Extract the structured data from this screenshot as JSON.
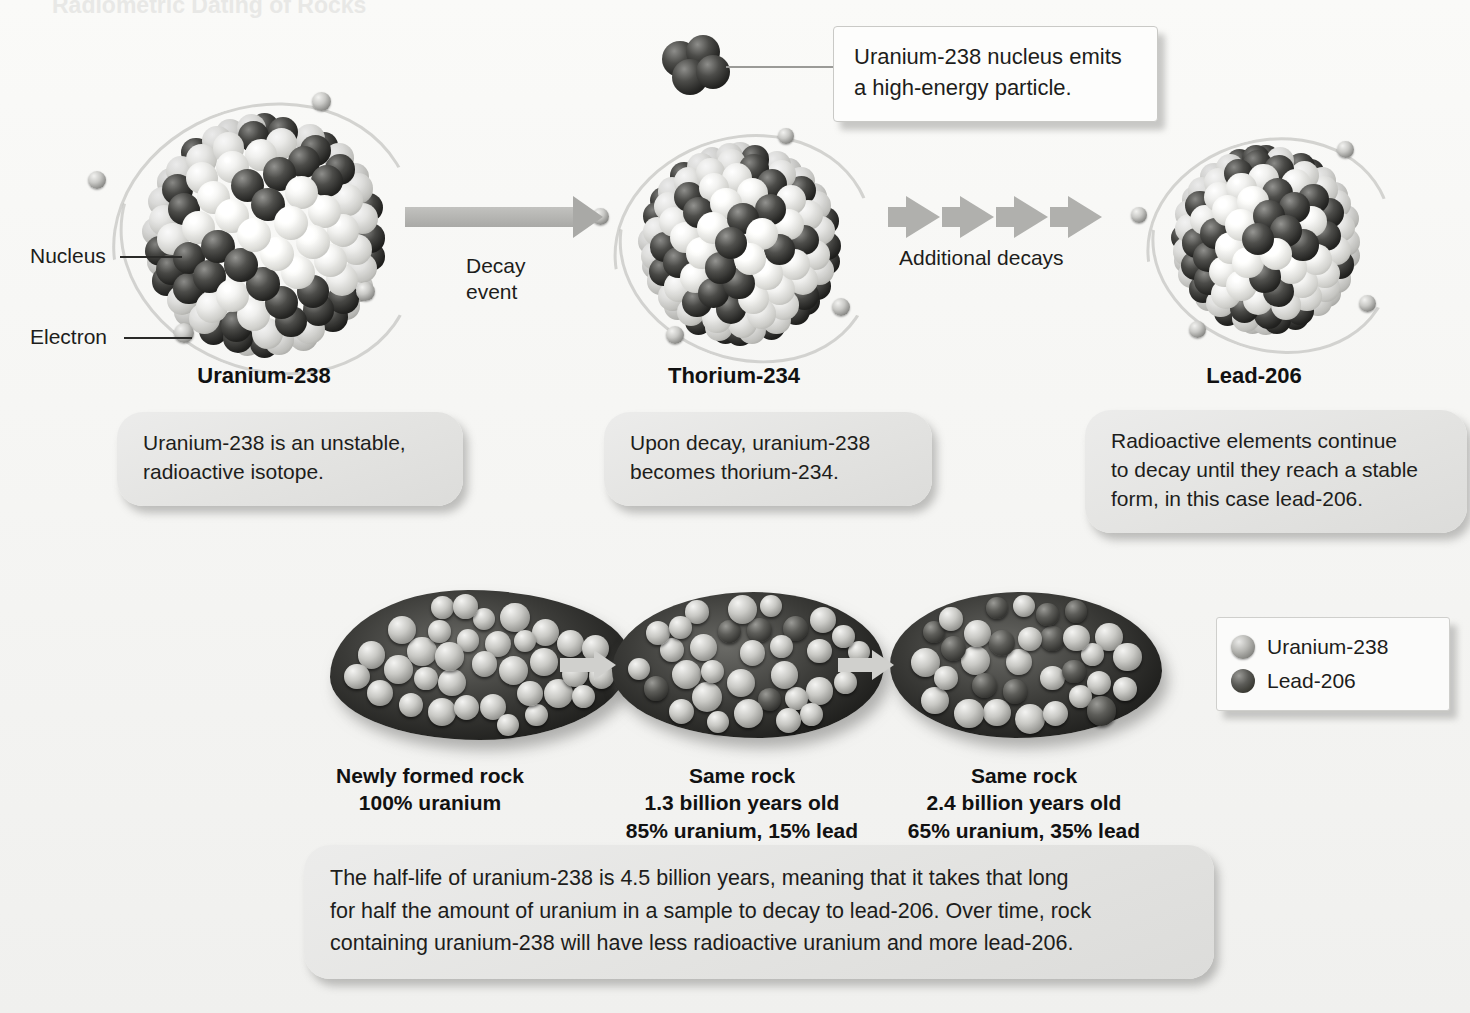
{
  "page": {
    "title_faint": "Radiometric Dating of Rocks",
    "background_color": "#f7f7f5"
  },
  "colors": {
    "uranium_sphere": "#b9b9b5",
    "lead_sphere": "#4a4a47",
    "callout_bg": "#fdfdfc",
    "pill_bg": "#e6e6e4",
    "arrow": "#a9a9a6",
    "text": "#1d1d1b"
  },
  "top_callout": {
    "text": "Uranium-238 nucleus emits\na high-energy particle."
  },
  "side_labels": [
    {
      "name": "nucleus",
      "text": "Nucleus"
    },
    {
      "name": "electron",
      "text": "Electron"
    }
  ],
  "process_labels": [
    {
      "name": "decay-event",
      "text": "Decay\nevent"
    },
    {
      "name": "additional-decays",
      "text": "Additional decays"
    }
  ],
  "stages": [
    {
      "id": "uranium-238",
      "isotope_label": "Uranium-238",
      "caption": "Uranium-238 is an unstable,\nradioactive isotope."
    },
    {
      "id": "thorium-234",
      "isotope_label": "Thorium-234",
      "caption": "Upon decay, uranium-238\nbecomes thorium-234."
    },
    {
      "id": "lead-206",
      "isotope_label": "Lead-206",
      "caption": "Radioactive elements continue\nto decay until they reach a stable\nform, in this case lead-206."
    }
  ],
  "rocks": [
    {
      "id": "rock-new",
      "caption": "Newly formed rock\n100% uranium",
      "age": "0",
      "uranium_percent": 100,
      "lead_percent": 0
    },
    {
      "id": "rock-1-3",
      "caption": "Same rock\n1.3 billion years old\n85% uranium, 15% lead",
      "age": "1.3 billion years old",
      "uranium_percent": 85,
      "lead_percent": 15
    },
    {
      "id": "rock-2-4",
      "caption": "Same rock\n2.4 billion years old\n65% uranium, 35% lead",
      "age": "2.4 billion years old",
      "uranium_percent": 65,
      "lead_percent": 35
    }
  ],
  "legend": {
    "items": [
      {
        "swatch": "uranium-sphere-icon",
        "label": "Uranium-238"
      },
      {
        "swatch": "lead-sphere-icon",
        "label": "Lead-206"
      }
    ]
  },
  "bottom_note": {
    "text": "The half-life of uranium-238 is 4.5 billion years, meaning that it takes that long\nfor half the amount of uranium in a sample to decay to lead-206. Over time, rock\ncontaining uranium-238 will have less radioactive uranium and more lead-206."
  },
  "chart_data": {
    "type": "bar",
    "xlabel": "Rock age",
    "ylabel": "Percent of sample",
    "ylim": [
      0,
      100
    ],
    "categories": [
      "Newly formed rock",
      "1.3 billion years old",
      "2.4 billion years old"
    ],
    "series": [
      {
        "name": "Uranium-238",
        "values": [
          100,
          85,
          65
        ]
      },
      {
        "name": "Lead-206",
        "values": [
          0,
          15,
          35
        ]
      }
    ],
    "annotations": [
      "Half-life of uranium-238 is 4.5 billion years",
      "Uranium-238 decays to thorium-234, then eventually to stable lead-206"
    ]
  }
}
